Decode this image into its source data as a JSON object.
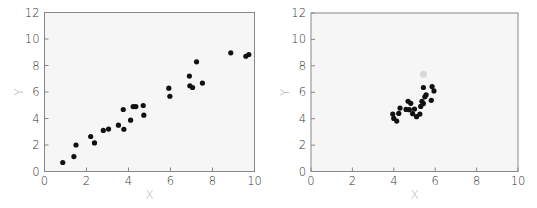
{
  "chart_data": [
    {
      "type": "scatter",
      "title": "",
      "xlabel": "X",
      "ylabel": "Y",
      "xlim": [
        0,
        10
      ],
      "ylim": [
        0,
        12
      ],
      "xticks": [
        "0",
        "2",
        "4",
        "6",
        "8",
        "10"
      ],
      "yticks": [
        "0",
        "2",
        "4",
        "6",
        "8",
        "10",
        "12"
      ],
      "grid": false,
      "colors": {
        "point": "#111111",
        "plot_bg": "#f6f6f6",
        "frame": "#888888"
      },
      "series": [
        {
          "name": "data",
          "points": [
            [
              0.87,
              0.68
            ],
            [
              1.4,
              1.13
            ],
            [
              1.5,
              2.0
            ],
            [
              2.2,
              2.64
            ],
            [
              2.38,
              2.16
            ],
            [
              2.8,
              3.1
            ],
            [
              3.05,
              3.2
            ],
            [
              3.52,
              3.5
            ],
            [
              3.75,
              4.68
            ],
            [
              3.78,
              3.19
            ],
            [
              4.1,
              3.87
            ],
            [
              4.22,
              4.9
            ],
            [
              4.35,
              4.9
            ],
            [
              4.7,
              4.98
            ],
            [
              4.73,
              4.25
            ],
            [
              5.92,
              6.29
            ],
            [
              5.97,
              5.68
            ],
            [
              6.9,
              7.2
            ],
            [
              6.92,
              6.47
            ],
            [
              7.05,
              6.34
            ],
            [
              7.24,
              8.28
            ],
            [
              7.52,
              6.67
            ],
            [
              8.87,
              8.96
            ],
            [
              9.59,
              8.7
            ],
            [
              9.73,
              8.83
            ]
          ]
        }
      ]
    },
    {
      "type": "scatter",
      "title": "",
      "xlabel": "X",
      "ylabel": "Y",
      "xlim": [
        0,
        10
      ],
      "ylim": [
        0,
        12
      ],
      "xticks": [
        "0",
        "2",
        "4",
        "6",
        "8",
        "10"
      ],
      "yticks": [
        "0",
        "2",
        "4",
        "6",
        "8",
        "10",
        "12"
      ],
      "grid": false,
      "colors": {
        "point": "#111111",
        "faint_point": "#d8d8d8",
        "plot_bg": "#f6f6f6",
        "frame": "#888888"
      },
      "series": [
        {
          "name": "data",
          "points": [
            [
              3.95,
              4.35
            ],
            [
              4.0,
              4.02
            ],
            [
              4.14,
              3.82
            ],
            [
              4.24,
              4.4
            ],
            [
              4.3,
              4.8
            ],
            [
              4.59,
              4.7
            ],
            [
              4.69,
              5.32
            ],
            [
              4.75,
              4.68
            ],
            [
              4.82,
              5.16
            ],
            [
              4.91,
              4.38
            ],
            [
              5.0,
              4.73
            ],
            [
              5.1,
              4.15
            ],
            [
              5.26,
              4.35
            ],
            [
              5.3,
              4.93
            ],
            [
              5.36,
              5.32
            ],
            [
              5.43,
              5.14
            ],
            [
              5.43,
              6.36
            ],
            [
              5.5,
              5.65
            ],
            [
              5.56,
              5.8
            ],
            [
              5.81,
              5.39
            ],
            [
              5.85,
              6.43
            ],
            [
              5.94,
              6.1
            ]
          ]
        },
        {
          "name": "faint",
          "points": [
            [
              5.43,
              7.37
            ]
          ]
        }
      ]
    }
  ]
}
